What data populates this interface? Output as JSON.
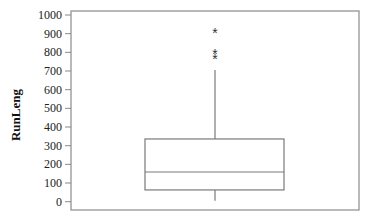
{
  "chart_data": {
    "type": "box",
    "title": "",
    "xlabel": "",
    "ylabel": "RunLeng",
    "ylim": [
      0,
      1000
    ],
    "yticks": [
      0,
      100,
      200,
      300,
      400,
      500,
      600,
      700,
      800,
      900,
      1000
    ],
    "ytick_labels": [
      "0",
      "100",
      "200",
      "300",
      "400",
      "500",
      "600",
      "700",
      "800",
      "900",
      "1000"
    ],
    "grid": false,
    "legend": null,
    "series": [
      {
        "name": "RunLeng",
        "whisker_low": 5,
        "q1": 63,
        "median": 159,
        "q3": 336,
        "whisker_high": 705,
        "outliers": [
          910,
          795,
          770
        ],
        "outlier_marker": "*"
      }
    ]
  },
  "colors": {
    "frame": "#8a8a8a",
    "box": "#7a7a7a",
    "text": "#222222"
  }
}
